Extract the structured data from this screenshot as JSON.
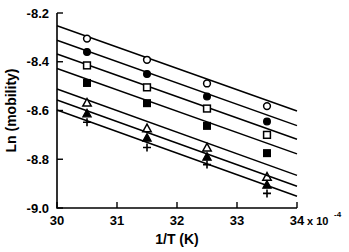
{
  "chart_data": {
    "type": "line",
    "title": "",
    "subtitle": "",
    "xlabel": "1/T (K)",
    "ylabel": "Ln (mobility)",
    "x_multiplier_base": "x 10",
    "x_multiplier_exponent": "-4",
    "xlim": [
      30,
      34
    ],
    "ylim": [
      -9.0,
      -8.2
    ],
    "xticks": [
      30,
      31,
      32,
      33,
      34
    ],
    "xticklabels": [
      "30",
      "31",
      "32",
      "33",
      "34"
    ],
    "yticks": [
      -9.0,
      -8.8,
      -8.6,
      -8.4,
      -8.2
    ],
    "yticklabels": [
      "-9.0",
      "-8.8",
      "-8.6",
      "-8.4",
      "-8.2"
    ],
    "grid": false,
    "legend": "none",
    "marker_x": [
      30.5,
      31.5,
      32.5,
      33.5
    ],
    "series": [
      {
        "name": "series-1",
        "marker": "open-circle",
        "x": [
          30.5,
          31.5,
          32.5,
          33.5
        ],
        "values": [
          -8.305,
          -8.392,
          -8.489,
          -8.582
        ],
        "fit_intercept": -8.252,
        "fit_slope": -0.0875
      },
      {
        "name": "series-2",
        "marker": "filled-circle",
        "x": [
          30.5,
          31.5,
          32.5,
          33.5
        ],
        "values": [
          -8.36,
          -8.45,
          -8.543,
          -8.645
        ],
        "fit_intercept": -8.312,
        "fit_slope": -0.0875
      },
      {
        "name": "series-3",
        "marker": "open-square",
        "x": [
          30.5,
          31.5,
          32.5,
          33.5
        ],
        "values": [
          -8.415,
          -8.505,
          -8.592,
          -8.7
        ],
        "fit_intercept": -8.368,
        "fit_slope": -0.0875
      },
      {
        "name": "series-4",
        "marker": "filled-square",
        "x": [
          30.5,
          31.5,
          32.5,
          33.5
        ],
        "values": [
          -8.487,
          -8.57,
          -8.663,
          -8.775
        ],
        "fit_intercept": -8.428,
        "fit_slope": -0.0875
      },
      {
        "name": "series-5",
        "marker": "open-triangle",
        "x": [
          30.5,
          31.5,
          32.5,
          33.5
        ],
        "values": [
          -8.568,
          -8.673,
          -8.752,
          -8.872
        ],
        "fit_intercept": -8.512,
        "fit_slope": -0.0885
      },
      {
        "name": "series-6",
        "marker": "filled-triangle",
        "x": [
          30.5,
          31.5,
          32.5,
          33.5
        ],
        "values": [
          -8.612,
          -8.712,
          -8.79,
          -8.905
        ],
        "fit_intercept": -8.557,
        "fit_slope": -0.0885
      },
      {
        "name": "series-7",
        "marker": "plus",
        "x": [
          30.5,
          31.5,
          32.5,
          33.5
        ],
        "values": [
          -8.648,
          -8.752,
          -8.822,
          -8.94
        ],
        "fit_intercept": -8.598,
        "fit_slope": -0.0885
      }
    ]
  }
}
